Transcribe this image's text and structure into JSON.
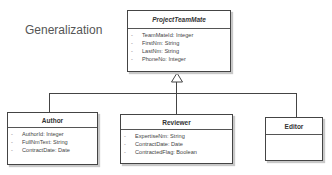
{
  "diagram": {
    "title": "Generalization",
    "relationship": "generalization",
    "parent": {
      "name": "ProjectTeamMate",
      "abstract": true,
      "attributes": [
        {
          "vis": "-",
          "text": "TeamMateId: Integer"
        },
        {
          "vis": "-",
          "text": "FirstNm: String"
        },
        {
          "vis": "-",
          "text": "LastNm: String"
        },
        {
          "vis": "-",
          "text": "PhoneNo: Integer"
        }
      ]
    },
    "children": [
      {
        "name": "Author",
        "attributes": [
          {
            "vis": "-",
            "text": "AuthorId: Integer"
          },
          {
            "vis": "-",
            "text": "FullNmText: String"
          },
          {
            "vis": "-",
            "text": "ContractDate: Date"
          }
        ]
      },
      {
        "name": "Reviewer",
        "attributes": [
          {
            "vis": "-",
            "text": "ExpertiseNm: String"
          },
          {
            "vis": "-",
            "text": "ContractDate: Date"
          },
          {
            "vis": "-",
            "text": "ContractedFlag: Boolean"
          }
        ]
      },
      {
        "name": "Editor",
        "attributes": []
      }
    ]
  }
}
